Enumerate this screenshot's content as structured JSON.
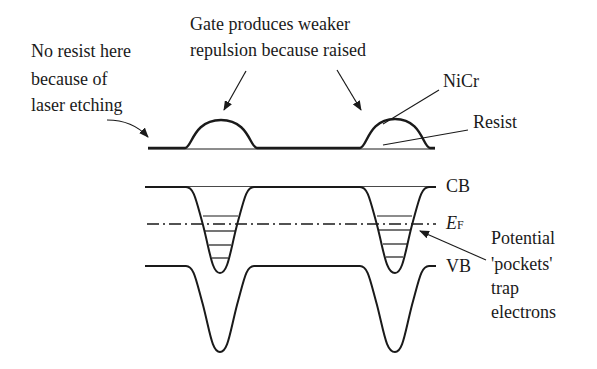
{
  "diagram": {
    "type": "band-diagram",
    "annotations": {
      "no_resist": [
        "No resist here",
        "because of",
        "laser etching"
      ],
      "gate": [
        "Gate produces weaker",
        "repulsion because raised"
      ],
      "nicr": "NiCr",
      "resist": "Resist",
      "pockets": [
        "Potential",
        "'pockets'",
        "trap",
        "electrons"
      ]
    },
    "band_labels": {
      "cb": "CB",
      "ef_main": "E",
      "ef_sub": "F",
      "vb": "VB"
    },
    "colors": {
      "ink": "#1a1a1a",
      "background": "#ffffff"
    }
  }
}
